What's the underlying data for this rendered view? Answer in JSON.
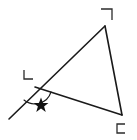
{
  "figure": {
    "type": "geometry-diagram",
    "background_color": "#ffffff",
    "stroke_color": "#1a1a1a",
    "canvas": {
      "width": 137,
      "height": 140
    },
    "triangle": {
      "name": "main-triangle",
      "vertices": [
        {
          "label": "apex",
          "x": 105,
          "y": 26
        },
        {
          "label": "left",
          "x": 35,
          "y": 87
        },
        {
          "label": "bottom-right",
          "x": 122,
          "y": 115
        }
      ],
      "path": "M 105 26 L 35 87 L 122 115 Z"
    },
    "ray": {
      "name": "extended-ray",
      "description": "ray from apex through left vertex continuing beyond",
      "from": {
        "x": 105,
        "y": 26
      },
      "through": {
        "x": 35,
        "y": 87
      },
      "to": {
        "x": 9,
        "y": 119
      },
      "path": "M 105 26 L 9 119"
    },
    "angle_arc": {
      "name": "exterior-angle-arc",
      "center": {
        "x": 35,
        "y": 87
      },
      "radius": 17,
      "path": "M 24 100 A 17 17 0 0 0 51 92"
    },
    "star": {
      "name": "star-marker",
      "glyph": "★",
      "x": 41,
      "y": 104,
      "size": 11,
      "color": "#111111"
    },
    "corner_marks": [
      {
        "name": "corner-mark-top-right",
        "glyph": "¬",
        "orientation": "top-right",
        "x": 101,
        "y": 9,
        "size": 11,
        "path": "M 101 9 L 112 9 L 112 20"
      },
      {
        "name": "corner-mark-left",
        "glyph": "L",
        "orientation": "bottom-left",
        "x": 24,
        "y": 70,
        "size": 10,
        "path": "M 24 70 L 24 79 L 33 79"
      },
      {
        "name": "corner-mark-bottom-right",
        "glyph": "⊏",
        "orientation": "left-open",
        "x": 117,
        "y": 124,
        "size": 9,
        "path": "M 125 124 L 117 124 L 117 133 L 125 133"
      }
    ]
  }
}
